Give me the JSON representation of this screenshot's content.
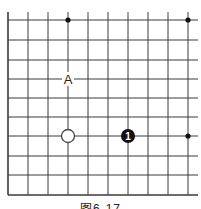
{
  "figure": {
    "caption": "图6-17",
    "board": {
      "description": "Go board corner diagram",
      "columns": 10,
      "rows": 10,
      "line_color": "#333333",
      "edges": [
        "left",
        "bottom"
      ]
    },
    "stones": [
      {
        "color": "white",
        "col": 3,
        "row": 6,
        "label": ""
      },
      {
        "color": "black",
        "col": 6,
        "row": 6,
        "label": "1"
      }
    ],
    "star_points": [
      {
        "col": 3,
        "row": 0
      },
      {
        "col": 9,
        "row": 0
      },
      {
        "col": 9,
        "row": 6
      }
    ],
    "markers": [
      {
        "label": "A",
        "col": 3,
        "row": 3
      }
    ]
  }
}
